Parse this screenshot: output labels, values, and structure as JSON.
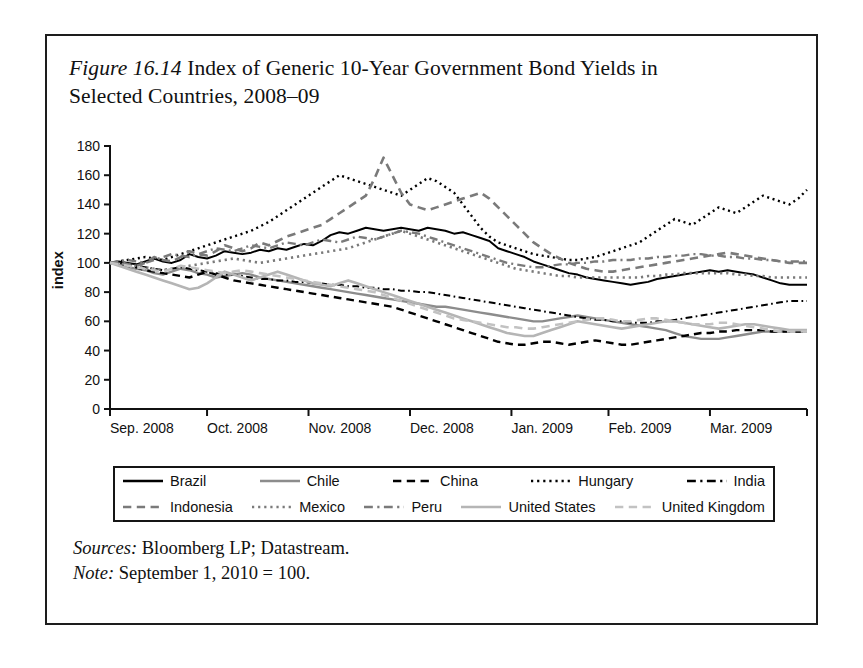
{
  "figure": {
    "number": "Figure 16.14",
    "title_rest": " Index of Generic 10-Year Government Bond Yields in Selected Countries, 2008–09",
    "sources_label": "Sources:",
    "sources_text": " Bloomberg LP; Datastream.",
    "note_label": "Note:",
    "note_text": " September 1, 2010 = 100."
  },
  "chart_data": {
    "type": "line",
    "title": "Figure 16.14 Index of Generic 10-Year Government Bond Yields in Selected Countries, 2008–09",
    "xlabel": "",
    "ylabel": "index",
    "ylim": [
      0,
      180
    ],
    "yticks": [
      0,
      20,
      40,
      60,
      80,
      100,
      120,
      140,
      160,
      180
    ],
    "xticklabels": [
      "Sep. 2008",
      "Oct. 2008",
      "Nov. 2008",
      "Dec. 2008",
      "Jan. 2009",
      "Feb. 2009",
      "Mar. 2009"
    ],
    "xtick_positions": [
      0,
      22,
      45,
      68,
      91,
      113,
      136
    ],
    "xlim": [
      0,
      158
    ],
    "grid": false,
    "legend_position": "below",
    "x": [
      0,
      2,
      4,
      6,
      8,
      10,
      12,
      14,
      16,
      18,
      20,
      22,
      24,
      26,
      28,
      30,
      32,
      34,
      36,
      38,
      40,
      42,
      44,
      46,
      48,
      50,
      52,
      54,
      56,
      58,
      60,
      62,
      64,
      66,
      68,
      70,
      72,
      74,
      76,
      78,
      80,
      82,
      84,
      86,
      88,
      90,
      92,
      94,
      96,
      98,
      100,
      102,
      104,
      106,
      108,
      110,
      112,
      114,
      116,
      118,
      120,
      122,
      124,
      126,
      128,
      130,
      132,
      134,
      136,
      138,
      140,
      142,
      144,
      146,
      148,
      150,
      152,
      154,
      156,
      158
    ],
    "series": [
      {
        "name": "Brazil",
        "color": "#000000",
        "style": "solid",
        "width": 2.0,
        "values": [
          100,
          101,
          100,
          99,
          101,
          103,
          101,
          100,
          102,
          106,
          104,
          103,
          105,
          108,
          107,
          106,
          107,
          109,
          108,
          110,
          109,
          111,
          113,
          112,
          115,
          119,
          121,
          120,
          122,
          124,
          123,
          122,
          123,
          124,
          123,
          122,
          124,
          123,
          122,
          120,
          121,
          119,
          117,
          115,
          110,
          108,
          106,
          104,
          101,
          99,
          97,
          95,
          93,
          92,
          90,
          89,
          88,
          87,
          86,
          85,
          86,
          87,
          89,
          90,
          91,
          92,
          93,
          94,
          95,
          94,
          95,
          94,
          93,
          92,
          90,
          88,
          86,
          85,
          85,
          85
        ]
      },
      {
        "name": "Chile",
        "color": "#8c8c8c",
        "style": "solid",
        "width": 2.4,
        "values": [
          100,
          99,
          97,
          96,
          95,
          93,
          92,
          94,
          96,
          95,
          93,
          92,
          90,
          91,
          92,
          93,
          92,
          90,
          89,
          88,
          87,
          86,
          85,
          84,
          83,
          82,
          81,
          80,
          79,
          78,
          77,
          76,
          75,
          74,
          73,
          72,
          71,
          70,
          70,
          69,
          68,
          67,
          66,
          65,
          64,
          63,
          62,
          61,
          60,
          60,
          61,
          62,
          63,
          64,
          63,
          62,
          61,
          60,
          59,
          58,
          57,
          56,
          55,
          54,
          52,
          50,
          49,
          48,
          48,
          48,
          49,
          50,
          51,
          52,
          53,
          53,
          53,
          53,
          53,
          53
        ]
      },
      {
        "name": "China",
        "color": "#000000",
        "style": "dashed",
        "width": 2.4,
        "values": [
          100,
          99,
          98,
          97,
          95,
          94,
          93,
          92,
          91,
          90,
          92,
          94,
          92,
          90,
          88,
          87,
          86,
          85,
          84,
          83,
          82,
          81,
          80,
          79,
          78,
          77,
          76,
          75,
          74,
          73,
          72,
          71,
          70,
          68,
          66,
          64,
          62,
          60,
          58,
          56,
          54,
          52,
          50,
          48,
          46,
          45,
          44,
          44,
          45,
          46,
          46,
          45,
          44,
          45,
          46,
          47,
          46,
          45,
          44,
          44,
          45,
          46,
          47,
          48,
          49,
          50,
          51,
          52,
          52,
          53,
          53,
          54,
          54,
          54,
          54,
          53,
          53,
          53,
          53,
          53
        ]
      },
      {
        "name": "Hungary",
        "color": "#000000",
        "style": "dotted",
        "width": 2.4,
        "values": [
          100,
          101,
          102,
          103,
          104,
          103,
          102,
          104,
          106,
          108,
          110,
          112,
          114,
          116,
          118,
          120,
          122,
          125,
          128,
          132,
          136,
          140,
          144,
          148,
          152,
          156,
          160,
          158,
          156,
          154,
          152,
          150,
          148,
          146,
          150,
          154,
          158,
          156,
          152,
          148,
          140,
          132,
          124,
          118,
          114,
          112,
          110,
          108,
          106,
          105,
          104,
          103,
          102,
          102,
          103,
          104,
          106,
          108,
          110,
          112,
          114,
          118,
          122,
          126,
          130,
          128,
          126,
          130,
          134,
          138,
          136,
          134,
          138,
          142,
          146,
          144,
          142,
          140,
          144,
          150
        ]
      },
      {
        "name": "India",
        "color": "#000000",
        "style": "dashdot",
        "width": 2.0,
        "values": [
          100,
          100,
          99,
          98,
          97,
          96,
          95,
          96,
          97,
          96,
          95,
          94,
          93,
          92,
          92,
          91,
          90,
          89,
          89,
          88,
          88,
          87,
          87,
          86,
          86,
          85,
          85,
          84,
          84,
          83,
          83,
          82,
          82,
          81,
          81,
          80,
          80,
          79,
          78,
          77,
          76,
          75,
          74,
          73,
          72,
          71,
          70,
          69,
          68,
          67,
          66,
          65,
          64,
          63,
          62,
          61,
          61,
          60,
          60,
          59,
          59,
          59,
          60,
          60,
          61,
          62,
          63,
          64,
          65,
          66,
          67,
          68,
          69,
          70,
          71,
          72,
          73,
          74,
          74,
          74
        ]
      },
      {
        "name": "Indonesia",
        "color": "#7a7a7a",
        "style": "dashed",
        "width": 2.6,
        "values": [
          100,
          101,
          99,
          98,
          100,
          104,
          102,
          101,
          104,
          108,
          106,
          105,
          108,
          112,
          110,
          108,
          110,
          114,
          112,
          115,
          118,
          120,
          122,
          124,
          126,
          130,
          134,
          138,
          142,
          146,
          158,
          172,
          160,
          148,
          140,
          138,
          136,
          138,
          140,
          142,
          144,
          146,
          148,
          144,
          138,
          132,
          126,
          120,
          114,
          110,
          106,
          103,
          100,
          98,
          96,
          95,
          94,
          94,
          95,
          96,
          97,
          98,
          99,
          100,
          101,
          102,
          103,
          104,
          105,
          106,
          107,
          106,
          105,
          104,
          103,
          102,
          101,
          100,
          100,
          100
        ]
      },
      {
        "name": "Mexico",
        "color": "#7a7a7a",
        "style": "dotted",
        "width": 2.6,
        "values": [
          100,
          100,
          99,
          98,
          97,
          96,
          95,
          96,
          97,
          98,
          99,
          100,
          101,
          102,
          103,
          102,
          101,
          100,
          101,
          102,
          103,
          104,
          105,
          106,
          107,
          108,
          109,
          110,
          112,
          114,
          116,
          118,
          120,
          122,
          120,
          118,
          116,
          114,
          112,
          110,
          108,
          106,
          104,
          102,
          100,
          98,
          96,
          95,
          94,
          93,
          92,
          91,
          91,
          90,
          90,
          90,
          90,
          90,
          90,
          90,
          90,
          91,
          91,
          92,
          92,
          93,
          93,
          93,
          93,
          93,
          93,
          92,
          92,
          91,
          91,
          90,
          90,
          90,
          90,
          90
        ]
      },
      {
        "name": "Peru",
        "color": "#7a7a7a",
        "style": "dashdot",
        "width": 2.4,
        "values": [
          100,
          101,
          102,
          101,
          100,
          102,
          104,
          106,
          105,
          104,
          106,
          108,
          110,
          109,
          108,
          110,
          112,
          111,
          110,
          112,
          114,
          113,
          112,
          114,
          116,
          115,
          114,
          116,
          118,
          117,
          116,
          118,
          120,
          122,
          121,
          120,
          118,
          116,
          114,
          112,
          110,
          108,
          106,
          104,
          102,
          100,
          99,
          98,
          97,
          97,
          98,
          99,
          99,
          100,
          100,
          101,
          101,
          102,
          102,
          102,
          103,
          103,
          104,
          104,
          105,
          105,
          106,
          106,
          105,
          105,
          104,
          104,
          103,
          103,
          102,
          102,
          101,
          101,
          101,
          101
        ]
      },
      {
        "name": "United States",
        "color": "#b5b5b5",
        "style": "solid",
        "width": 2.6,
        "values": [
          100,
          98,
          96,
          94,
          92,
          90,
          88,
          86,
          84,
          82,
          83,
          86,
          90,
          94,
          92,
          90,
          88,
          90,
          92,
          94,
          92,
          90,
          88,
          86,
          85,
          84,
          86,
          88,
          86,
          84,
          82,
          80,
          78,
          76,
          74,
          72,
          70,
          68,
          66,
          64,
          62,
          60,
          58,
          56,
          54,
          52,
          51,
          50,
          50,
          52,
          54,
          56,
          58,
          60,
          59,
          58,
          57,
          56,
          55,
          56,
          57,
          58,
          59,
          60,
          60,
          59,
          58,
          57,
          56,
          55,
          56,
          57,
          58,
          58,
          57,
          56,
          55,
          54,
          54,
          54
        ]
      },
      {
        "name": "United Kingdom",
        "color": "#c2c2c2",
        "style": "dashed",
        "width": 2.6,
        "values": [
          100,
          99,
          98,
          97,
          96,
          95,
          94,
          96,
          98,
          97,
          96,
          95,
          94,
          93,
          94,
          95,
          94,
          93,
          92,
          91,
          90,
          89,
          88,
          87,
          86,
          85,
          84,
          83,
          82,
          81,
          80,
          78,
          76,
          74,
          72,
          70,
          68,
          66,
          64,
          62,
          61,
          60,
          59,
          58,
          57,
          56,
          56,
          55,
          55,
          56,
          57,
          58,
          59,
          60,
          61,
          62,
          62,
          61,
          60,
          60,
          61,
          62,
          62,
          61,
          60,
          59,
          58,
          58,
          58,
          59,
          59,
          58,
          57,
          56,
          55,
          54,
          53,
          53,
          53,
          53
        ]
      }
    ]
  },
  "legend": {
    "rows": [
      [
        {
          "label": "Brazil",
          "color": "#000000",
          "style": "solid"
        },
        {
          "label": "Chile",
          "color": "#8c8c8c",
          "style": "solid"
        },
        {
          "label": "China",
          "color": "#000000",
          "style": "dashed"
        },
        {
          "label": "Hungary",
          "color": "#000000",
          "style": "dotted"
        },
        {
          "label": "India",
          "color": "#000000",
          "style": "dashdot"
        }
      ],
      [
        {
          "label": "Indonesia",
          "color": "#7a7a7a",
          "style": "dashed"
        },
        {
          "label": "Mexico",
          "color": "#7a7a7a",
          "style": "dotted"
        },
        {
          "label": "Peru",
          "color": "#7a7a7a",
          "style": "dashdot"
        },
        {
          "label": "United States",
          "color": "#b5b5b5",
          "style": "solid"
        },
        {
          "label": "United Kingdom",
          "color": "#c2c2c2",
          "style": "dashed"
        }
      ]
    ]
  }
}
